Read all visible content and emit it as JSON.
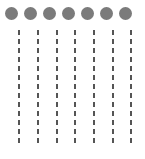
{
  "diagram": {
    "type": "lifelines",
    "colors": {
      "head": "#7b7b7b",
      "dash": "#555555",
      "background": "#ffffff"
    },
    "lanes": [
      {
        "head_x": 5,
        "line_x": 18
      },
      {
        "head_x": 24,
        "line_x": 37
      },
      {
        "head_x": 43,
        "line_x": 56
      },
      {
        "head_x": 62,
        "line_x": 74
      },
      {
        "head_x": 81,
        "line_x": 93
      },
      {
        "head_x": 100,
        "line_x": 112
      },
      {
        "head_x": 119,
        "line_x": 130
      }
    ]
  }
}
